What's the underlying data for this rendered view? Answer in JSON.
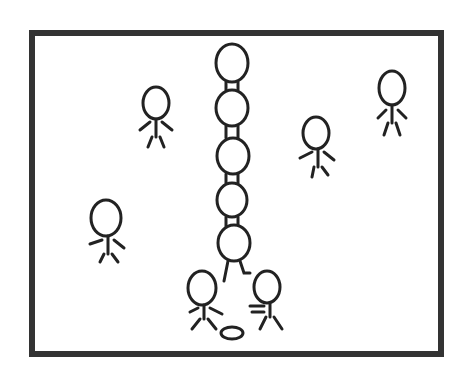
{
  "illustration": {
    "description": "Cartoon of stick-figure characters: a tower of six figures stacked on each other's shoulders, with several bystanders around and a ball on the ground",
    "border_color": "#333333",
    "line_color": "#222222",
    "background": "#ffffff",
    "figures_count": 12
  }
}
